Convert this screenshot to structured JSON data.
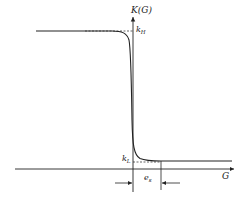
{
  "diagram": {
    "y_axis_label": "K(G)",
    "x_axis_label": "G",
    "k_high_label": "k",
    "k_high_sub": "H",
    "k_low_label": "k",
    "k_low_sub": "L",
    "width_label": "e",
    "width_sub": "s",
    "colors": {
      "ink": "#222222",
      "background": "#ffffff"
    }
  }
}
